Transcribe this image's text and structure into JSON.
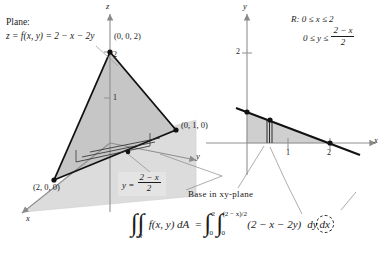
{
  "figure": {
    "width": 382,
    "height": 253,
    "background": "#ffffff",
    "ink": "#1a1a1a",
    "shade_light": "#d9d9d9",
    "shade_mid": "#c9c9c9",
    "shade_dark": "#b4b4b4"
  },
  "plane_caption": {
    "line1": "Plane:",
    "line2_lhs": "z = f(x, y) = 2 − x − 2y"
  },
  "region_caption": {
    "label": "R:",
    "x_bounds": "0 ≤ x ≤ 2",
    "y_bounds_prefix": "0 ≤ y ≤",
    "y_bounds_num": "2 − x",
    "y_bounds_den": "2"
  },
  "solid_3d": {
    "axes": [
      {
        "name": "z-axis",
        "label": "z"
      },
      {
        "name": "y-axis",
        "label": "y"
      },
      {
        "name": "x-axis",
        "label": "x"
      }
    ],
    "vertices": [
      {
        "name": "z-intercept",
        "label": "(0, 0, 2)"
      },
      {
        "name": "y-intercept",
        "label": "(0, 1, 0)"
      },
      {
        "name": "x-intercept",
        "label": "(2, 0, 0)"
      }
    ],
    "z_ticks": [
      "2",
      "1"
    ],
    "callout_prefix": "y =",
    "callout_num": "2 − x",
    "callout_den": "2"
  },
  "base_label": "Base in xy-plane",
  "region_2d": {
    "axes": [
      {
        "name": "y-axis",
        "label": "y"
      },
      {
        "name": "x-axis",
        "label": "x"
      }
    ],
    "y_ticks": [
      "2"
    ],
    "x_ticks": [
      "1",
      "2"
    ]
  },
  "equation": {
    "double_integral_sub": "R",
    "integrand_left": "f(x, y) dA",
    "equals": "=",
    "outer_upper": "2",
    "outer_lower": "0",
    "inner_upper": "(2 − x)/2",
    "inner_lower": "0",
    "integrand_right": "(2 − x − 2y)",
    "dy": "dy",
    "dx": "dx"
  }
}
